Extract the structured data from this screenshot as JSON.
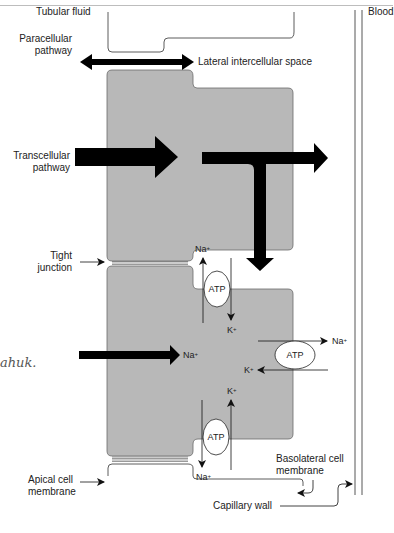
{
  "figure": {
    "type": "epithelial transport diagram",
    "regions": {
      "left": "Tubular fluid",
      "right": "Blood"
    },
    "labels": {
      "tubular_fluid": "Tubular fluid",
      "blood": "Blood",
      "paracellular": [
        "Paracellular",
        "pathway"
      ],
      "lateral_space": "Lateral intercellular space",
      "transcellular": [
        "Transcellular",
        "pathway"
      ],
      "tight_junction": [
        "Tight",
        "junction"
      ],
      "apical_membrane": [
        "Apical cell",
        "membrane"
      ],
      "basolateral_membrane": [
        "Basolateral cell",
        "membrane"
      ],
      "capillary_wall": "Capillary wall"
    },
    "pumps": [
      {
        "id": "pump-top",
        "label": "ATP",
        "out_ion": "Na",
        "in_ion": "K"
      },
      {
        "id": "pump-right",
        "label": "ATP",
        "out_ion": "Na",
        "in_ion": "K"
      },
      {
        "id": "pump-bottom",
        "label": "ATP",
        "out_ion": "Na",
        "in_ion": "K"
      }
    ],
    "ions": {
      "na": "Na",
      "k": "K",
      "charge": "+"
    },
    "entry_arrow_label": "Na",
    "handwriting": "ahuk."
  },
  "colors": {
    "cell_fill": "#b8b8b8",
    "cell_stroke": "#6a6a6a",
    "arrow": "#000000",
    "line": "#333333"
  }
}
